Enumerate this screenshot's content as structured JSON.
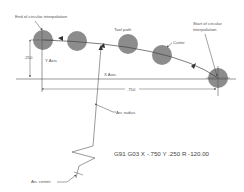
{
  "diagram": {
    "labels": {
      "end": "End of circular interpolation",
      "start_line1": "Start of circular",
      "start_line2": "interpolation",
      "tool_path": "Tool path",
      "cutter": "Cutter",
      "y_axis": "Y Axis",
      "x_axis": "X Axis",
      "y_dim": ".250",
      "x_dim": ".750",
      "arc_radius": "Arc radius",
      "arc_center": "Arc center"
    },
    "code": "G91 G03  X -.750  Y .250  R -120.00",
    "colors": {
      "cutter_fill": "#8c8c8c",
      "line": "#555555",
      "text": "#555555"
    }
  }
}
